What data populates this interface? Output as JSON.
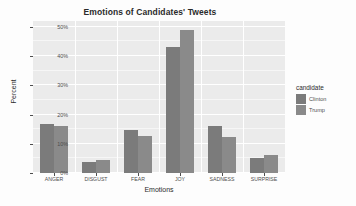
{
  "chart_data": {
    "type": "bar",
    "title": "Emotions of Candidates' Tweets",
    "xlabel": "Emotions",
    "ylabel": "Percent",
    "categories": [
      "ANGER",
      "DISGUST",
      "FEAR",
      "JOY",
      "SADNESS",
      "SURPRISE"
    ],
    "series": [
      {
        "name": "Clinton",
        "color": "#7b7b7b",
        "values": [
          16.9,
          3.7,
          14.8,
          43.0,
          16.2,
          5.1
        ]
      },
      {
        "name": "Trump",
        "color": "#8a8a8a",
        "values": [
          16.2,
          4.4,
          12.5,
          49.0,
          12.2,
          6.2
        ]
      }
    ],
    "ylim": [
      0,
      52
    ],
    "ytick_values": [
      0,
      10,
      20,
      30,
      40,
      50
    ],
    "ytick_labels": [
      "0%",
      "10%",
      "20%",
      "30%",
      "40%",
      "50%"
    ],
    "grid": true,
    "legend": {
      "title": "candidate",
      "position": "right",
      "entries": [
        "Clinton",
        "Trump"
      ]
    },
    "panel_background": "#ebebeb",
    "gridline_color": "#ffffff"
  }
}
